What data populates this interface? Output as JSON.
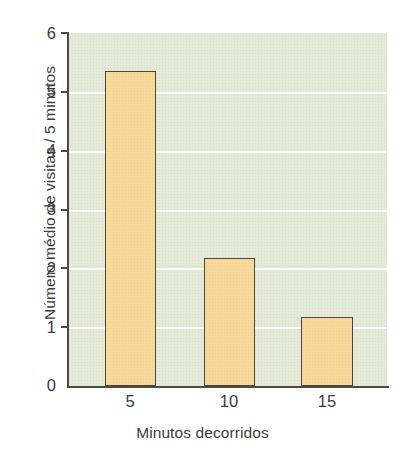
{
  "chart_data": {
    "type": "bar",
    "title": "",
    "subtitle": "",
    "categories": [
      "5",
      "10",
      "15"
    ],
    "values": [
      5.35,
      2.18,
      1.17
    ],
    "series": [
      {
        "name": "Número médio de visitas / 5 minutos",
        "values": [
          5.35,
          2.18,
          1.17
        ]
      }
    ],
    "xlabel": "Minutos decorridos",
    "ylabel": "Número médio de visitas / 5 minutos",
    "xlim": [
      0,
      20
    ],
    "ylim": [
      0,
      6
    ],
    "yticks": [
      0,
      1,
      2,
      3,
      4,
      5,
      6
    ],
    "ytick_labels": [
      "0",
      "1",
      "2",
      "3",
      "4",
      "5",
      "6"
    ],
    "xtick_labels": [
      "5",
      "10",
      "15"
    ],
    "grid": "horizontal",
    "gridlines_at": [
      1,
      2,
      3,
      4,
      5
    ],
    "legend": null,
    "legend_position": "none",
    "annotations": [],
    "colors": {
      "bar_fill": "#f9d89b",
      "bar_edge": "#4a4638",
      "panel_background": "#e5e9d7",
      "gridline": "#fdfdfa",
      "axis": "#4f4b41",
      "text": "#3c3c3c",
      "figure_background": "#ffffff"
    }
  }
}
